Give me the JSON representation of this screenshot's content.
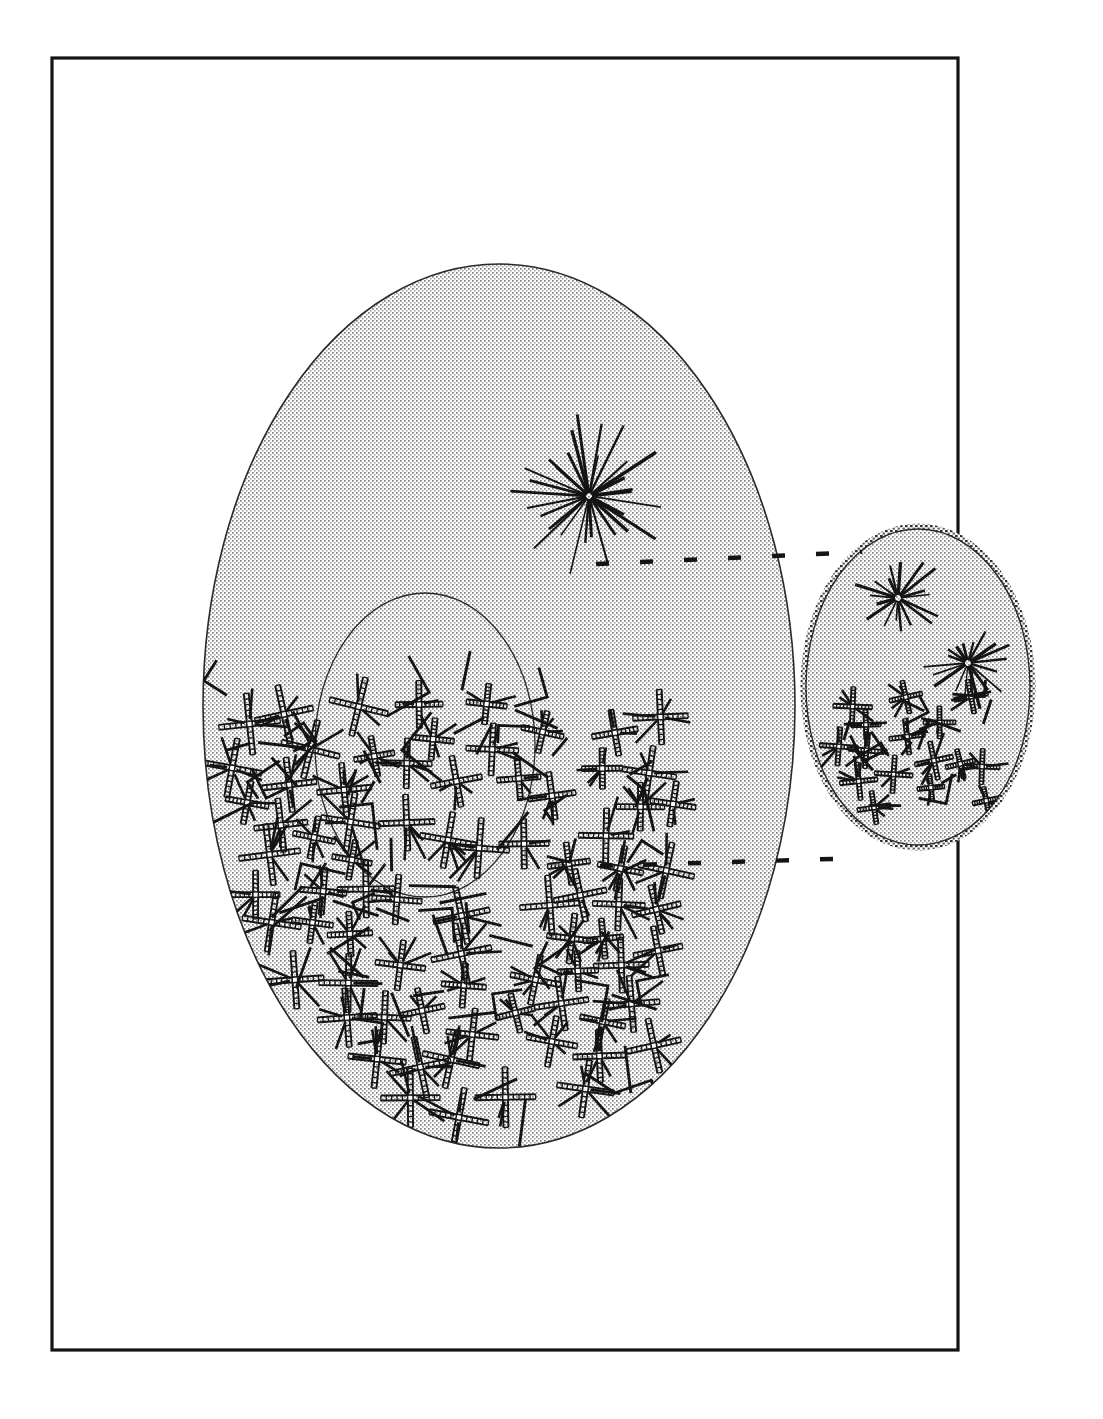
{
  "figure": {
    "title": "",
    "caption": "",
    "background_color": "#ffffff",
    "ink_color": "#141414",
    "stipple_color": "#8a8a8a",
    "width": 1103,
    "height": 1419
  },
  "frame": {
    "name": "plate-border",
    "x": 52,
    "y": 58,
    "width": 906,
    "height": 1292,
    "stroke": "#141414",
    "stroke_width": 3.2
  },
  "shapes": {
    "large_ellipse": {
      "label": "large-stippled-ellipse",
      "cx": 499,
      "cy": 706,
      "rx": 296,
      "ry": 442,
      "stroke": "#2a2a2a",
      "stroke_width": 1.6,
      "fill": "stipple"
    },
    "inner_ellipse": {
      "label": "inner-outlined-ellipse",
      "cx": 425,
      "cy": 745,
      "rx": 110,
      "ry": 152,
      "stroke": "#2a2a2a",
      "stroke_width": 1.3,
      "fill": "none"
    },
    "small_ellipse": {
      "label": "small-stippled-ellipse",
      "cx": 918,
      "cy": 687,
      "rx": 112,
      "ry": 158,
      "stroke": "#2a2a2a",
      "stroke_width": 1.4,
      "rim_width": 11,
      "fill": "stipple"
    }
  },
  "dashed_lines": [
    {
      "label": "upper-dashed-line",
      "y": 564,
      "x_start": 596,
      "x_end": 862,
      "dash": 13,
      "gap": 31,
      "stroke_width": 4.5,
      "tilt": -12
    },
    {
      "label": "lower-dashed-line",
      "y": 866,
      "x_start": 600,
      "x_end": 862,
      "dash": 13,
      "gap": 31,
      "stroke_width": 4.5,
      "tilt": -8
    }
  ],
  "starbursts": [
    {
      "label": "starburst-main",
      "cx": 589,
      "cy": 496,
      "rays": 30,
      "r_min": 34,
      "r_max": 86,
      "width": 2.6,
      "seed": 11
    },
    {
      "label": "starburst-small-upper",
      "cx": 898,
      "cy": 598,
      "rays": 18,
      "r_min": 20,
      "r_max": 48,
      "width": 2.4,
      "seed": 27
    },
    {
      "label": "starburst-small-lower",
      "cx": 968,
      "cy": 663,
      "rays": 18,
      "r_min": 20,
      "r_max": 48,
      "width": 2.4,
      "seed": 43
    }
  ],
  "mark_clusters": [
    {
      "label": "main-cross-cluster",
      "region": "large-ellipse-lower",
      "cross_count": 78,
      "stroke_count": 70,
      "bbox": {
        "x": 215,
        "y": 690,
        "width": 460,
        "height": 450
      },
      "cross_arm": 25,
      "cross_rail_gap": 5,
      "seed": 7
    },
    {
      "label": "small-cross-cluster",
      "region": "small-ellipse-lower",
      "cross_count": 16,
      "stroke_count": 14,
      "bbox": {
        "x": 838,
        "y": 686,
        "width": 150,
        "height": 140
      },
      "cross_arm": 17,
      "cross_rail_gap": 4,
      "seed": 91
    }
  ],
  "legend": {
    "visible": false,
    "items": []
  },
  "annotations": {
    "visible_text": []
  }
}
